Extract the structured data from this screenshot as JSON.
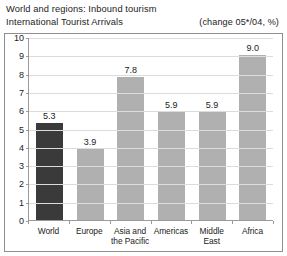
{
  "header": {
    "title": "World and regions: Inbound tourism",
    "subtitle": "International Tourist Arrivals",
    "change_note": "(change 05*/04, %)"
  },
  "colors": {
    "highlight_bar": "#3a3a3a",
    "default_bar": "#b0b0b0",
    "gridline": "#dcdcdc",
    "axis": "#9a9a9a",
    "frame": "#8f8f8f",
    "text": "#1b1b1b"
  },
  "chart_data": {
    "type": "bar",
    "title": "World and regions: Inbound tourism",
    "subtitle": "International Tourist Arrivals",
    "annotation": "(change 05*/04, %)",
    "xlabel": "",
    "ylabel": "",
    "ylim": [
      0,
      10
    ],
    "ytick_values": [
      0,
      1,
      2,
      3,
      4,
      5,
      6,
      7,
      8,
      9,
      10
    ],
    "ytick_labels": [
      "0",
      "1",
      "2",
      "3",
      "4",
      "5",
      "6",
      "7",
      "8",
      "9",
      "10"
    ],
    "grid": true,
    "legend": false,
    "categories": [
      "World",
      "Europe",
      "Asia and the Pacific",
      "Americas",
      "Middle East",
      "Africa"
    ],
    "values": [
      5.3,
      3.9,
      7.8,
      5.9,
      5.9,
      9.0
    ],
    "value_labels": [
      "5.3",
      "3.9",
      "7.8",
      "5.9",
      "5.9",
      "9.0"
    ],
    "highlight_index": 0
  }
}
